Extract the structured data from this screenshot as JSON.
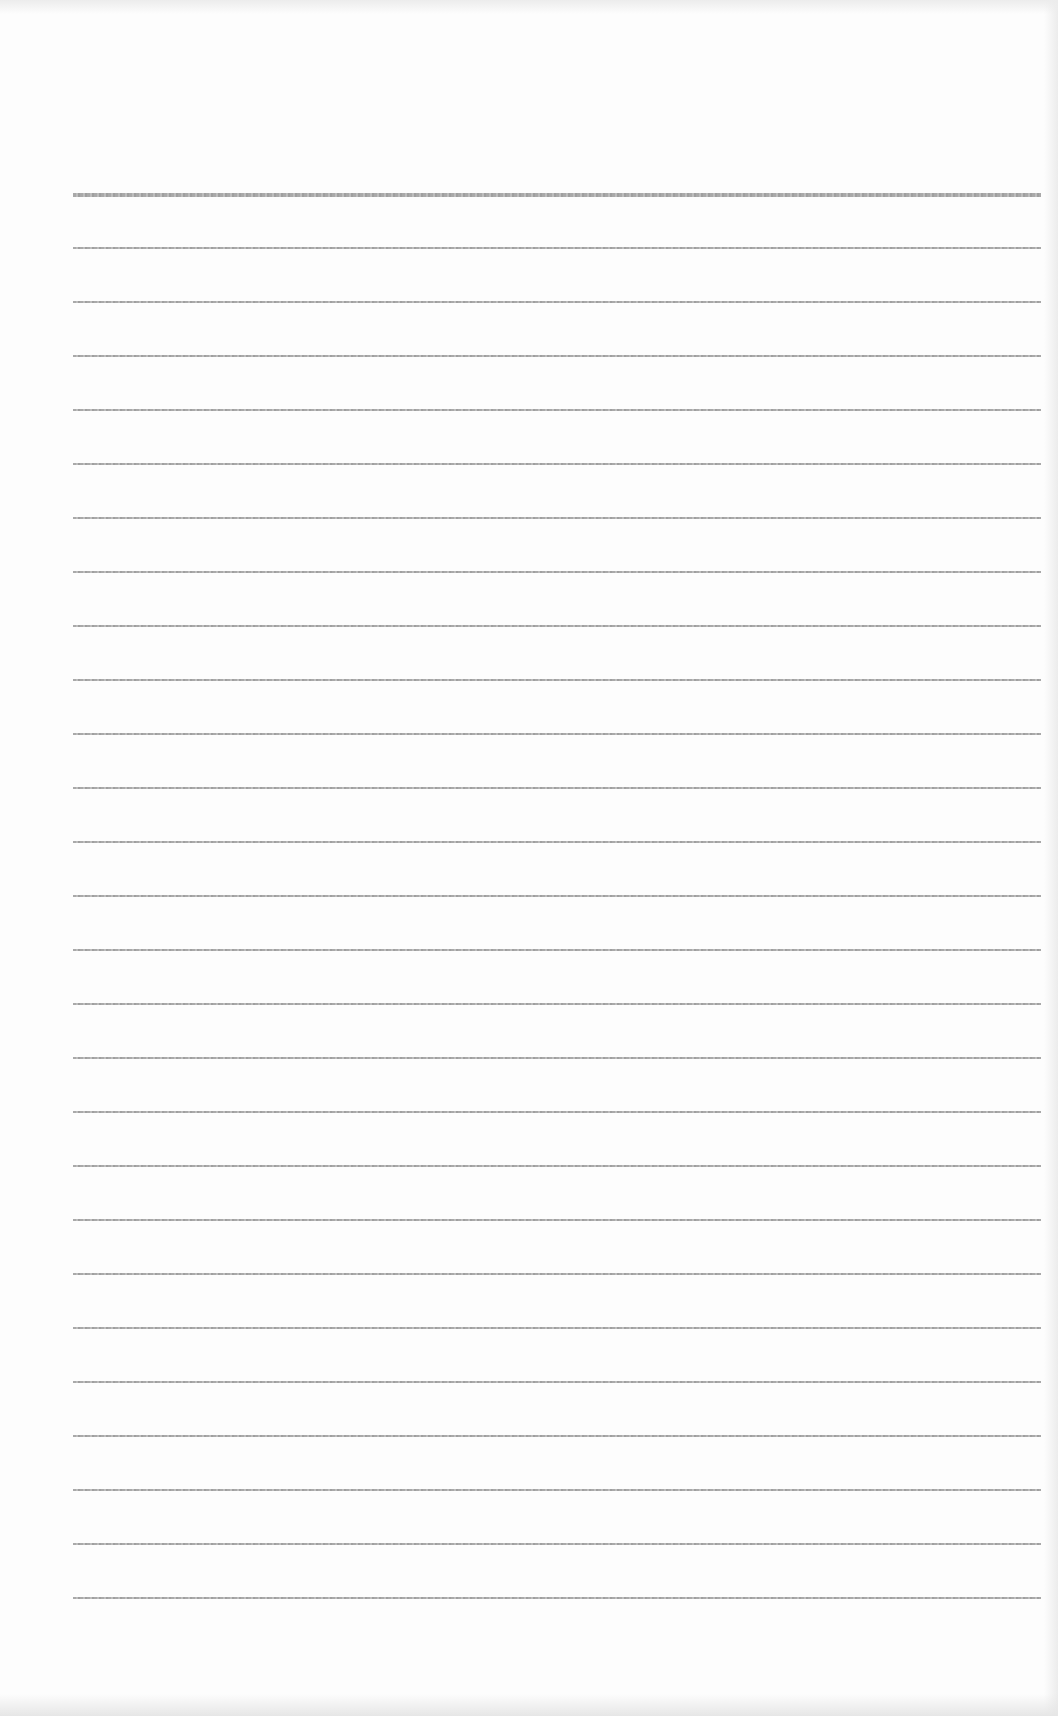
{
  "page": {
    "type": "blank lined paper",
    "background_color": "#fdfdfd",
    "line_color": "#a9a9a9",
    "line_count": 27,
    "first_line_y": 193,
    "line_spacing": 54,
    "line_left": 73,
    "line_width": 968
  }
}
